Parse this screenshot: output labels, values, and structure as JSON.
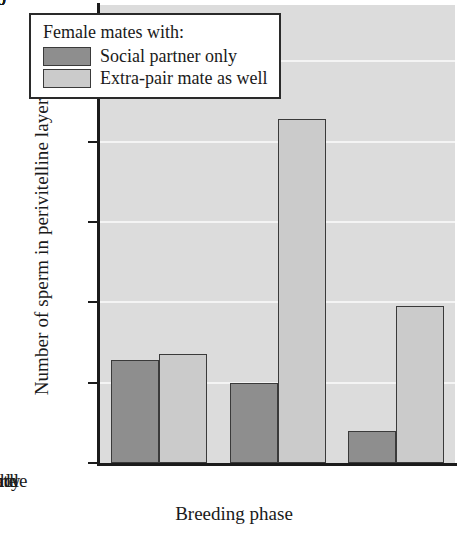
{
  "chart_data": {
    "type": "bar",
    "title": "",
    "xlabel": "Breeding phase",
    "ylabel": "Number of sperm in perivitelline layer",
    "categories": [
      "Early",
      "Middle",
      "Late"
    ],
    "series": [
      {
        "name": "Social partner only",
        "values": [
          64,
          50,
          20
        ],
        "color": "#8e8e8e"
      },
      {
        "name": "Extra-pair mate as well",
        "values": [
          68,
          214,
          98
        ],
        "color": "#cbcbcb"
      }
    ],
    "ylim": [
      0,
      285
    ],
    "yticks": [
      0,
      50,
      100,
      150,
      200,
      250
    ],
    "ytick_labels": [
      "0",
      "50",
      "100",
      "150",
      "200",
      "250"
    ],
    "grid": true,
    "grid_color": "#f4f4f4",
    "plot_background": "#dcdcdc",
    "legend": {
      "position": "top-left-inside",
      "title": "Female mates with:",
      "entries": [
        {
          "label": "Social partner only",
          "swatch": "dark-gray-swatch"
        },
        {
          "label": "Extra-pair mate as well",
          "swatch": "light-gray-swatch"
        }
      ]
    }
  }
}
